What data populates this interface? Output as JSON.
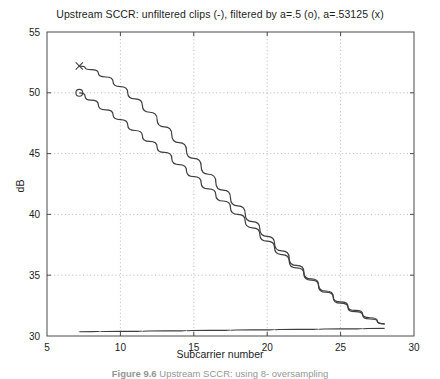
{
  "figure": {
    "title": "Upstream SCCR: unfiltered clips (-), filtered by a=.5 (o), a=.53125 (x)",
    "caption_number": "Figure 9.6",
    "caption_text": "Upstream SCCR: using 8- oversampling",
    "background_color": "#ffffff",
    "line_color": "#3f3f3f",
    "grid_color": "#b8b8b8",
    "axis_color": "#4a4a4a"
  },
  "chart_data": {
    "type": "line",
    "title": "Upstream SCCR: unfiltered clips (-), filtered by a=.5 (o), a=.53125 (x)",
    "xlabel": "Subcarrier number",
    "ylabel": "dB",
    "xlim": [
      5,
      30
    ],
    "ylim": [
      30,
      55
    ],
    "xticks": [
      5,
      10,
      15,
      20,
      25,
      30
    ],
    "yticks": [
      30,
      35,
      40,
      45,
      50,
      55
    ],
    "xtick_labels": [
      "5",
      "10",
      "15",
      "20",
      "25",
      "30"
    ],
    "ytick_labels": [
      "30",
      "35",
      "40",
      "45",
      "50",
      "55"
    ],
    "grid": true,
    "grid_style": "dotted",
    "legend": "in-title",
    "series": [
      {
        "name": "filtered by a=.53125 (x)",
        "marker": "x",
        "marker_x": 7.2,
        "marker_y": 52.2,
        "x": [
          7.2,
          8,
          9,
          10,
          11,
          12,
          13,
          14,
          15,
          16,
          17,
          18,
          19,
          20,
          21,
          22,
          23,
          24,
          25,
          26,
          27,
          28
        ],
        "y": [
          52.2,
          51.9,
          51.3,
          50.5,
          49.5,
          48.4,
          47.2,
          45.9,
          44.6,
          43.3,
          42.0,
          40.7,
          39.4,
          38.2,
          37.0,
          35.8,
          34.7,
          33.7,
          32.8,
          32.1,
          31.5,
          31.0
        ]
      },
      {
        "name": "filtered by a=.5 (o)",
        "marker": "o",
        "marker_x": 7.2,
        "marker_y": 50.0,
        "x": [
          7.2,
          8,
          9,
          10,
          11,
          12,
          13,
          14,
          15,
          16,
          17,
          18,
          19,
          20,
          21,
          22,
          23,
          24,
          25,
          26,
          27,
          28
        ],
        "y": [
          50.0,
          49.4,
          48.6,
          47.8,
          46.9,
          46.0,
          45.1,
          44.1,
          43.1,
          42.1,
          41.1,
          40.0,
          38.9,
          37.8,
          36.7,
          35.6,
          34.6,
          33.6,
          32.7,
          32.0,
          31.4,
          31.0
        ]
      },
      {
        "name": "unfiltered clips (-)",
        "marker": "none",
        "x": [
          7.2,
          10,
          13,
          16,
          19,
          22,
          25,
          28
        ],
        "y": [
          30.35,
          30.38,
          30.42,
          30.46,
          30.5,
          30.54,
          30.58,
          30.62
        ]
      }
    ]
  }
}
